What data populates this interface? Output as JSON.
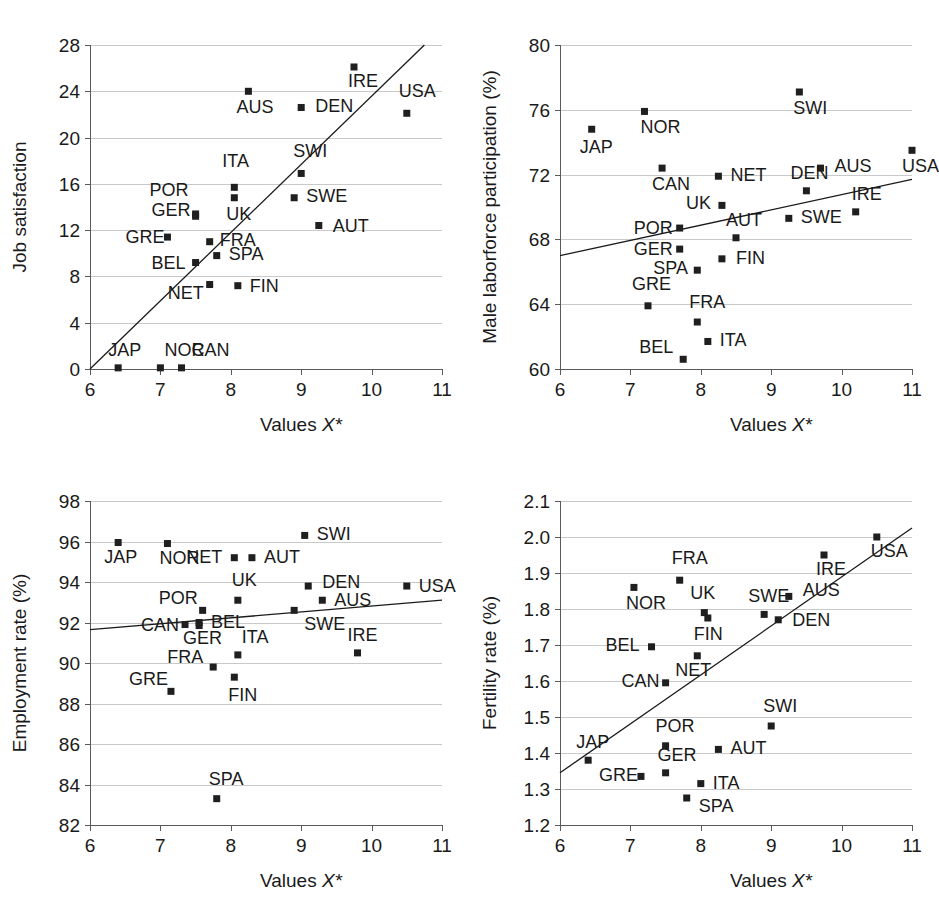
{
  "figure": {
    "panel_count": 4,
    "marker_color": "#1f1f1f",
    "gridline_color": "#c9c9c9",
    "axis_color": "#5a5a5a",
    "trendline_color": "#1a1a1a"
  },
  "chart_data": [
    {
      "id": "job-satisfaction",
      "type": "scatter",
      "title": "",
      "xlabel": "Values X*",
      "ylabel": "Job satisfaction",
      "xlim": [
        6,
        11
      ],
      "ylim": [
        0,
        28
      ],
      "xticks": [
        6,
        7,
        8,
        9,
        10,
        11
      ],
      "yticks": [
        0,
        4,
        8,
        12,
        16,
        20,
        24,
        28
      ],
      "grid": true,
      "legend": "none",
      "trendline": {
        "x0": 6.0,
        "y0": 0.0,
        "x1": 10.75,
        "y1": 28.0
      },
      "points": [
        {
          "label": "JAP",
          "x": 6.4,
          "y": 0.1,
          "lx": -10,
          "ly": -12
        },
        {
          "label": "NOR",
          "x": 7.0,
          "y": 0.1,
          "lx": 4,
          "ly": -12
        },
        {
          "label": "CAN",
          "x": 7.3,
          "y": 0.1,
          "lx": 10,
          "ly": -12
        },
        {
          "label": "GRE",
          "x": 7.1,
          "y": 11.4,
          "lx": -42,
          "ly": 6
        },
        {
          "label": "GER",
          "x": 7.5,
          "y": 13.2,
          "lx": -44,
          "ly": 0
        },
        {
          "label": "POR",
          "x": 7.5,
          "y": 13.4,
          "lx": -46,
          "ly": -18
        },
        {
          "label": "BEL",
          "x": 7.5,
          "y": 9.2,
          "lx": -44,
          "ly": 6
        },
        {
          "label": "NET",
          "x": 7.7,
          "y": 7.3,
          "lx": -42,
          "ly": 14
        },
        {
          "label": "FRA",
          "x": 7.7,
          "y": 11.0,
          "lx": 10,
          "ly": 4
        },
        {
          "label": "SPA",
          "x": 7.8,
          "y": 9.8,
          "lx": 12,
          "ly": 4
        },
        {
          "label": "ITA",
          "x": 8.05,
          "y": 15.7,
          "lx": -12,
          "ly": -20
        },
        {
          "label": "UK",
          "x": 8.05,
          "y": 14.8,
          "lx": -8,
          "ly": 22
        },
        {
          "label": "FIN",
          "x": 8.1,
          "y": 7.2,
          "lx": 12,
          "ly": 6
        },
        {
          "label": "AUS",
          "x": 8.25,
          "y": 24.0,
          "lx": -12,
          "ly": 22
        },
        {
          "label": "SWE",
          "x": 8.9,
          "y": 14.8,
          "lx": 12,
          "ly": 4
        },
        {
          "label": "SWI",
          "x": 9.0,
          "y": 16.9,
          "lx": -8,
          "ly": -16
        },
        {
          "label": "DEN",
          "x": 9.0,
          "y": 22.6,
          "lx": 14,
          "ly": 5
        },
        {
          "label": "AUT",
          "x": 9.25,
          "y": 12.4,
          "lx": 14,
          "ly": 6
        },
        {
          "label": "IRE",
          "x": 9.75,
          "y": 26.1,
          "lx": -6,
          "ly": 20
        },
        {
          "label": "USA",
          "x": 10.5,
          "y": 22.1,
          "lx": -8,
          "ly": -16
        }
      ]
    },
    {
      "id": "male-laborforce-participation",
      "type": "scatter",
      "title": "",
      "xlabel": "Values X*",
      "ylabel": "Male laborforce participation (%)",
      "xlim": [
        6,
        11
      ],
      "ylim": [
        60,
        80
      ],
      "xticks": [
        6,
        7,
        8,
        9,
        10,
        11
      ],
      "yticks": [
        60,
        64,
        68,
        72,
        76,
        80
      ],
      "grid": true,
      "legend": "none",
      "trendline": {
        "x0": 6.0,
        "y0": 67.0,
        "x1": 11.0,
        "y1": 71.7
      },
      "points": [
        {
          "label": "JAP",
          "x": 6.45,
          "y": 74.8,
          "lx": -12,
          "ly": 24
        },
        {
          "label": "NOR",
          "x": 7.2,
          "y": 75.9,
          "lx": -4,
          "ly": 22
        },
        {
          "label": "CAN",
          "x": 7.45,
          "y": 72.4,
          "lx": -10,
          "ly": 22
        },
        {
          "label": "POR",
          "x": 7.7,
          "y": 68.7,
          "lx": -46,
          "ly": 6
        },
        {
          "label": "GER",
          "x": 7.7,
          "y": 67.4,
          "lx": -46,
          "ly": 6
        },
        {
          "label": "BEL",
          "x": 7.75,
          "y": 60.6,
          "lx": -44,
          "ly": -6
        },
        {
          "label": "SPA",
          "x": 7.95,
          "y": 66.1,
          "lx": -44,
          "ly": 4
        },
        {
          "label": "FRA",
          "x": 7.95,
          "y": 62.9,
          "lx": -8,
          "ly": -14
        },
        {
          "label": "GRE",
          "x": 7.25,
          "y": 63.9,
          "lx": -16,
          "ly": -16
        },
        {
          "label": "NET",
          "x": 8.25,
          "y": 71.9,
          "lx": 12,
          "ly": 5
        },
        {
          "label": "UK",
          "x": 8.3,
          "y": 70.1,
          "lx": -36,
          "ly": 4
        },
        {
          "label": "ITA",
          "x": 8.1,
          "y": 61.7,
          "lx": 12,
          "ly": 5
        },
        {
          "label": "AUT",
          "x": 8.5,
          "y": 68.1,
          "lx": -10,
          "ly": -12
        },
        {
          "label": "FIN",
          "x": 8.3,
          "y": 66.8,
          "lx": 14,
          "ly": 5
        },
        {
          "label": "SWI",
          "x": 9.4,
          "y": 77.1,
          "lx": -6,
          "ly": 22
        },
        {
          "label": "SWE",
          "x": 9.25,
          "y": 69.3,
          "lx": 12,
          "ly": 5
        },
        {
          "label": "DEN",
          "x": 9.5,
          "y": 71.0,
          "lx": -16,
          "ly": -12
        },
        {
          "label": "AUS",
          "x": 9.7,
          "y": 72.4,
          "lx": 14,
          "ly": 4
        },
        {
          "label": "IRE",
          "x": 10.2,
          "y": 69.7,
          "lx": -4,
          "ly": -12
        },
        {
          "label": "USA",
          "x": 11.0,
          "y": 73.5,
          "lx": -10,
          "ly": 22
        }
      ]
    },
    {
      "id": "employment-rate",
      "type": "scatter",
      "title": "",
      "xlabel": "Values X*",
      "ylabel": "Employment rate (%)",
      "xlim": [
        6,
        11
      ],
      "ylim": [
        82,
        98
      ],
      "xticks": [
        6,
        7,
        8,
        9,
        10,
        11
      ],
      "yticks": [
        82,
        84,
        86,
        88,
        90,
        92,
        94,
        96,
        98
      ],
      "grid": true,
      "legend": "none",
      "trendline": {
        "x0": 6.0,
        "y0": 91.65,
        "x1": 11.0,
        "y1": 93.1
      },
      "points": [
        {
          "label": "JAP",
          "x": 6.4,
          "y": 95.95,
          "lx": -14,
          "ly": 20
        },
        {
          "label": "NOR",
          "x": 7.1,
          "y": 95.9,
          "lx": -8,
          "ly": 20
        },
        {
          "label": "NET",
          "x": 8.05,
          "y": 95.2,
          "lx": -48,
          "ly": 5
        },
        {
          "label": "AUT",
          "x": 8.3,
          "y": 95.2,
          "lx": 12,
          "ly": 5
        },
        {
          "label": "SWI",
          "x": 9.05,
          "y": 96.3,
          "lx": 12,
          "ly": 5
        },
        {
          "label": "POR",
          "x": 7.6,
          "y": 92.6,
          "lx": -44,
          "ly": -6
        },
        {
          "label": "UK",
          "x": 8.1,
          "y": 93.1,
          "lx": -6,
          "ly": -14
        },
        {
          "label": "DEN",
          "x": 9.1,
          "y": 93.8,
          "lx": 14,
          "ly": 2
        },
        {
          "label": "USA",
          "x": 10.5,
          "y": 93.8,
          "lx": 12,
          "ly": 6
        },
        {
          "label": "AUS",
          "x": 9.3,
          "y": 93.1,
          "lx": 12,
          "ly": 6
        },
        {
          "label": "CAN",
          "x": 7.35,
          "y": 91.9,
          "lx": -44,
          "ly": 6
        },
        {
          "label": "BEL",
          "x": 7.55,
          "y": 92.0,
          "lx": 12,
          "ly": 5
        },
        {
          "label": "GER",
          "x": 7.55,
          "y": 91.85,
          "lx": -16,
          "ly": 18
        },
        {
          "label": "ITA",
          "x": 8.1,
          "y": 90.4,
          "lx": 4,
          "ly": -12
        },
        {
          "label": "SWE",
          "x": 8.9,
          "y": 92.6,
          "lx": 10,
          "ly": 20
        },
        {
          "label": "IRE",
          "x": 9.8,
          "y": 90.5,
          "lx": -10,
          "ly": -12
        },
        {
          "label": "FRA",
          "x": 7.75,
          "y": 89.8,
          "lx": -46,
          "ly": -4
        },
        {
          "label": "FIN",
          "x": 8.05,
          "y": 89.3,
          "lx": -6,
          "ly": 24
        },
        {
          "label": "GRE",
          "x": 7.15,
          "y": 88.6,
          "lx": -42,
          "ly": -6
        },
        {
          "label": "SPA",
          "x": 7.8,
          "y": 83.3,
          "lx": -8,
          "ly": -14
        }
      ]
    },
    {
      "id": "fertility-rate",
      "type": "scatter",
      "title": "",
      "xlabel": "Values X*",
      "ylabel": "Fertility rate (%)",
      "xlim": [
        6,
        11
      ],
      "ylim": [
        1.2,
        2.1
      ],
      "xticks": [
        6,
        7,
        8,
        9,
        10,
        11
      ],
      "yticks": [
        1.2,
        1.3,
        1.4,
        1.5,
        1.6,
        1.7,
        1.8,
        1.9,
        2.0,
        2.1
      ],
      "ytick_labels": [
        "1.2",
        "1.3",
        "1.4",
        "1.5",
        "1.6",
        "1.7",
        "1.8",
        "1.9",
        "2.0",
        "2.1"
      ],
      "grid": true,
      "legend": "none",
      "trendline": {
        "x0": 6.0,
        "y0": 1.345,
        "x1": 11.0,
        "y1": 2.025
      },
      "points": [
        {
          "label": "JAP",
          "x": 6.4,
          "y": 1.38,
          "lx": -12,
          "ly": -12
        },
        {
          "label": "NOR",
          "x": 7.05,
          "y": 1.86,
          "lx": -8,
          "ly": 22
        },
        {
          "label": "BEL",
          "x": 7.3,
          "y": 1.695,
          "lx": -46,
          "ly": 4
        },
        {
          "label": "CAN",
          "x": 7.5,
          "y": 1.595,
          "lx": -44,
          "ly": 4
        },
        {
          "label": "GRE",
          "x": 7.15,
          "y": 1.335,
          "lx": -42,
          "ly": 5
        },
        {
          "label": "POR",
          "x": 7.5,
          "y": 1.42,
          "lx": -10,
          "ly": -14
        },
        {
          "label": "GER",
          "x": 7.5,
          "y": 1.345,
          "lx": -8,
          "ly": -12
        },
        {
          "label": "FRA",
          "x": 7.7,
          "y": 1.88,
          "lx": -8,
          "ly": -16
        },
        {
          "label": "NET",
          "x": 7.95,
          "y": 1.67,
          "lx": -22,
          "ly": 20
        },
        {
          "label": "UK",
          "x": 8.05,
          "y": 1.79,
          "lx": -14,
          "ly": -14
        },
        {
          "label": "FIN",
          "x": 8.1,
          "y": 1.775,
          "lx": -14,
          "ly": 22
        },
        {
          "label": "ITA",
          "x": 8.0,
          "y": 1.315,
          "lx": 12,
          "ly": 5
        },
        {
          "label": "SPA",
          "x": 7.8,
          "y": 1.275,
          "lx": 12,
          "ly": 14
        },
        {
          "label": "AUT",
          "x": 8.25,
          "y": 1.41,
          "lx": 12,
          "ly": 5
        },
        {
          "label": "SWE",
          "x": 8.9,
          "y": 1.785,
          "lx": -16,
          "ly": -12
        },
        {
          "label": "SWI",
          "x": 9.0,
          "y": 1.475,
          "lx": -8,
          "ly": -14
        },
        {
          "label": "DEN",
          "x": 9.1,
          "y": 1.77,
          "lx": 14,
          "ly": 6
        },
        {
          "label": "AUS",
          "x": 9.25,
          "y": 1.835,
          "lx": 14,
          "ly": 0
        },
        {
          "label": "IRE",
          "x": 9.75,
          "y": 1.95,
          "lx": -8,
          "ly": 20
        },
        {
          "label": "USA",
          "x": 10.5,
          "y": 2.0,
          "lx": -6,
          "ly": 20
        }
      ]
    }
  ]
}
